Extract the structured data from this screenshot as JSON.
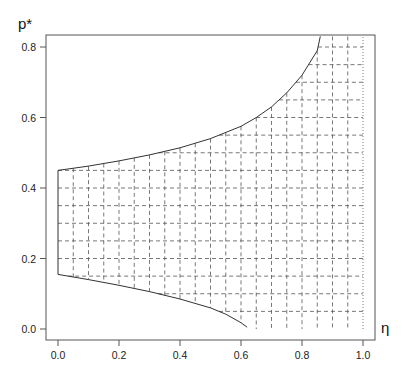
{
  "chart_data": {
    "type": "line",
    "title": "",
    "xlabel": "η",
    "ylabel": "p*",
    "xlim": [
      -0.03,
      1.03
    ],
    "ylim": [
      -0.03,
      0.83
    ],
    "xticks": [
      0.0,
      0.2,
      0.4,
      0.6,
      0.8,
      1.0
    ],
    "xtick_labels": [
      "0.0",
      "0.2",
      "0.4",
      "0.6",
      "0.8",
      "1.0"
    ],
    "yticks": [
      0.0,
      0.2,
      0.4,
      0.6,
      0.8
    ],
    "ytick_labels": [
      "0.0",
      "0.2",
      "0.4",
      "0.6",
      "0.8"
    ],
    "grid": false,
    "legend": null,
    "series": [
      {
        "name": "upper boundary",
        "style": "solid",
        "x": [
          0.0,
          0.1,
          0.2,
          0.3,
          0.4,
          0.5,
          0.6,
          0.65,
          0.7,
          0.75,
          0.8,
          0.85,
          0.86
        ],
        "y": [
          0.45,
          0.462,
          0.477,
          0.494,
          0.514,
          0.54,
          0.575,
          0.6,
          0.63,
          0.67,
          0.72,
          0.79,
          0.83
        ]
      },
      {
        "name": "lower boundary",
        "style": "solid",
        "x": [
          0.0,
          0.1,
          0.2,
          0.3,
          0.4,
          0.5,
          0.55,
          0.6,
          0.62
        ],
        "y": [
          0.155,
          0.14,
          0.124,
          0.106,
          0.085,
          0.06,
          0.042,
          0.018,
          0.005
        ]
      },
      {
        "name": "left edge",
        "style": "solid",
        "x": [
          0.0,
          0.0
        ],
        "y": [
          0.155,
          0.45
        ]
      },
      {
        "name": "eta = 1 boundary",
        "style": "dotted",
        "x": [
          1.0,
          1.0
        ],
        "y": [
          0.0,
          0.83
        ]
      }
    ],
    "hatching": {
      "description": "dashed grid filling feasible region between lower and upper boundary",
      "vertical_lines_x": [
        0.05,
        0.1,
        0.15,
        0.2,
        0.25,
        0.3,
        0.35,
        0.4,
        0.45,
        0.5,
        0.55,
        0.6,
        0.65,
        0.7,
        0.75,
        0.8,
        0.85,
        0.9,
        0.95
      ],
      "horizontal_lines_y": [
        0.05,
        0.1,
        0.15,
        0.2,
        0.25,
        0.3,
        0.35,
        0.4,
        0.45,
        0.5,
        0.55,
        0.6,
        0.65,
        0.7,
        0.75,
        0.8
      ]
    }
  },
  "colors": {
    "line": "#333333",
    "hatch": "#555555",
    "axis": "#555555"
  }
}
